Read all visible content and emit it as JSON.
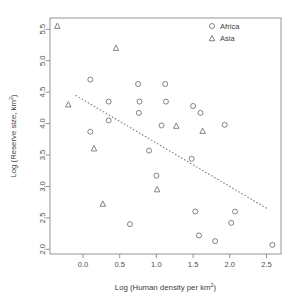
{
  "chart_data": {
    "type": "scatter",
    "title": "",
    "xlabel": "Log (Human density per km²)",
    "ylabel": "Log (Reserve size, km²)",
    "xlabel_main": "Log (Human density per km",
    "xlabel_sup": "2",
    "xlabel_tail": ")",
    "ylabel_main": "Log (Reserve size, km",
    "ylabel_sup": "2",
    "ylabel_tail": ")",
    "xlim": [
      -0.45,
      2.75
    ],
    "ylim": [
      1.93,
      5.62
    ],
    "xticks": [
      0.0,
      0.5,
      1.0,
      1.5,
      2.0,
      2.5
    ],
    "xtick_labels": [
      "0.0",
      "0.5",
      "1.0",
      "1.5",
      "2.0",
      "2.5"
    ],
    "yticks": [
      2.0,
      2.5,
      3.0,
      3.5,
      4.0,
      4.5,
      5.0,
      5.5
    ],
    "ytick_labels": [
      "2.0",
      "2.5",
      "3.0",
      "3.5",
      "4.0",
      "4.5",
      "5.0",
      "5.5"
    ],
    "grid": false,
    "legend_position": "top-right",
    "legend": [
      {
        "name": "Africa",
        "marker": "circle"
      },
      {
        "name": "Asia",
        "marker": "triangle"
      }
    ],
    "series": [
      {
        "name": "Africa",
        "marker": "circle",
        "points": [
          [
            0.1,
            4.7
          ],
          [
            0.35,
            4.35
          ],
          [
            0.35,
            4.05
          ],
          [
            0.1,
            3.87
          ],
          [
            0.75,
            4.63
          ],
          [
            1.12,
            4.63
          ],
          [
            0.77,
            4.35
          ],
          [
            1.13,
            4.35
          ],
          [
            0.76,
            4.17
          ],
          [
            1.07,
            3.97
          ],
          [
            1.5,
            4.28
          ],
          [
            1.6,
            4.17
          ],
          [
            1.93,
            3.98
          ],
          [
            0.9,
            3.57
          ],
          [
            1.48,
            3.44
          ],
          [
            1.0,
            3.17
          ],
          [
            0.64,
            2.4
          ],
          [
            1.53,
            2.6
          ],
          [
            2.07,
            2.6
          ],
          [
            2.02,
            2.42
          ],
          [
            1.58,
            2.22
          ],
          [
            1.8,
            2.13
          ],
          [
            2.58,
            2.07
          ]
        ]
      },
      {
        "name": "Asia",
        "marker": "triangle",
        "points": [
          [
            -0.35,
            5.55
          ],
          [
            0.45,
            5.2
          ],
          [
            -0.2,
            4.3
          ],
          [
            0.15,
            3.6
          ],
          [
            0.27,
            2.72
          ],
          [
            1.27,
            3.96
          ],
          [
            1.63,
            3.88
          ],
          [
            1.01,
            2.95
          ]
        ]
      }
    ],
    "trend_line": {
      "style": "dotted",
      "x_start": -0.1,
      "y_start": 4.45,
      "x_end": 2.52,
      "y_end": 2.64
    }
  }
}
